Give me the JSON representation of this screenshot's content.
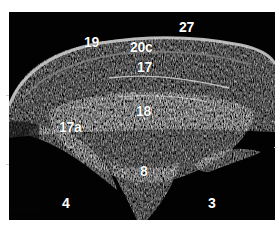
{
  "image": {
    "type": "ultrasound scan (grayscale B-mode)",
    "background": "#020202",
    "frame_border": "#ffffff"
  },
  "labels": [
    {
      "id": "27",
      "text": "27"
    },
    {
      "id": "19",
      "text": "19"
    },
    {
      "id": "20c",
      "text": "20c"
    },
    {
      "id": "17",
      "text": "17"
    },
    {
      "id": "18",
      "text": "18"
    },
    {
      "id": "17a",
      "text": "17a"
    },
    {
      "id": "8",
      "text": "8"
    },
    {
      "id": "4",
      "text": "4"
    },
    {
      "id": "3",
      "text": "3"
    }
  ]
}
